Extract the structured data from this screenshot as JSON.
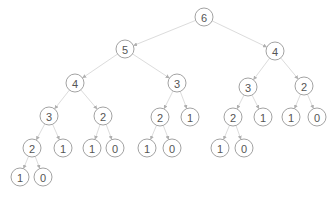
{
  "diagram": {
    "type": "tree",
    "edge_color": "#dcdcdc",
    "node_stroke": "#8a8a8a",
    "text_color": "#555555",
    "node_radius": 9,
    "nodes": [
      {
        "id": "n0",
        "label": "6",
        "x": 204,
        "y": 17
      },
      {
        "id": "n1",
        "label": "5",
        "x": 125,
        "y": 49
      },
      {
        "id": "n2",
        "label": "4",
        "x": 275,
        "y": 51
      },
      {
        "id": "n3",
        "label": "4",
        "x": 75,
        "y": 83
      },
      {
        "id": "n4",
        "label": "3",
        "x": 177,
        "y": 83
      },
      {
        "id": "n5",
        "label": "3",
        "x": 248,
        "y": 87
      },
      {
        "id": "n6",
        "label": "2",
        "x": 304,
        "y": 86
      },
      {
        "id": "n7",
        "label": "3",
        "x": 49,
        "y": 116
      },
      {
        "id": "n8",
        "label": "2",
        "x": 103,
        "y": 116
      },
      {
        "id": "n9",
        "label": "2",
        "x": 160,
        "y": 117
      },
      {
        "id": "n10",
        "label": "1",
        "x": 190,
        "y": 117
      },
      {
        "id": "n11",
        "label": "2",
        "x": 233,
        "y": 117
      },
      {
        "id": "n12",
        "label": "1",
        "x": 263,
        "y": 117
      },
      {
        "id": "n13",
        "label": "1",
        "x": 291,
        "y": 117
      },
      {
        "id": "n14",
        "label": "0",
        "x": 317,
        "y": 117
      },
      {
        "id": "n15",
        "label": "2",
        "x": 32,
        "y": 148
      },
      {
        "id": "n16",
        "label": "1",
        "x": 63,
        "y": 148
      },
      {
        "id": "n17",
        "label": "1",
        "x": 92,
        "y": 148
      },
      {
        "id": "n18",
        "label": "0",
        "x": 115,
        "y": 148
      },
      {
        "id": "n19",
        "label": "1",
        "x": 147,
        "y": 148
      },
      {
        "id": "n20",
        "label": "0",
        "x": 172,
        "y": 148
      },
      {
        "id": "n21",
        "label": "1",
        "x": 220,
        "y": 148
      },
      {
        "id": "n22",
        "label": "0",
        "x": 244,
        "y": 148
      },
      {
        "id": "n23",
        "label": "1",
        "x": 20,
        "y": 177
      },
      {
        "id": "n24",
        "label": "0",
        "x": 43,
        "y": 177
      }
    ],
    "edges": [
      [
        "n0",
        "n1"
      ],
      [
        "n0",
        "n2"
      ],
      [
        "n1",
        "n3"
      ],
      [
        "n1",
        "n4"
      ],
      [
        "n2",
        "n5"
      ],
      [
        "n2",
        "n6"
      ],
      [
        "n3",
        "n7"
      ],
      [
        "n3",
        "n8"
      ],
      [
        "n4",
        "n9"
      ],
      [
        "n4",
        "n10"
      ],
      [
        "n5",
        "n11"
      ],
      [
        "n5",
        "n12"
      ],
      [
        "n6",
        "n13"
      ],
      [
        "n6",
        "n14"
      ],
      [
        "n7",
        "n15"
      ],
      [
        "n7",
        "n16"
      ],
      [
        "n8",
        "n17"
      ],
      [
        "n8",
        "n18"
      ],
      [
        "n9",
        "n19"
      ],
      [
        "n9",
        "n20"
      ],
      [
        "n11",
        "n21"
      ],
      [
        "n11",
        "n22"
      ],
      [
        "n15",
        "n23"
      ],
      [
        "n15",
        "n24"
      ]
    ]
  }
}
